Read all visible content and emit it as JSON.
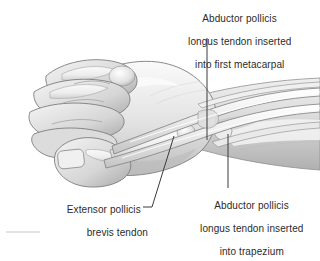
{
  "figure": {
    "kind": "anatomical-illustration",
    "style": "grayscale pen-and-ink medical drawing",
    "background_color": "#ffffff",
    "text_color": "#2b2b2b",
    "leader_color": "#3a3a3a"
  },
  "labels": {
    "apl_metacarpal": {
      "line1": "Abductor pollicis",
      "line2": "longus tendon inserted",
      "line3": "into first metacarpal"
    },
    "apl_trapezium": {
      "line1": "Abductor pollicis",
      "line2": "longus tendon inserted",
      "line3": "into trapezium"
    },
    "epb": {
      "line1": "Extensor pollicis",
      "line2": "brevis tendon"
    }
  },
  "leaders": [
    {
      "name": "leader-apl-metacarpal",
      "orientation": "vertical",
      "from": [
        207,
        38
      ],
      "to": [
        207,
        140
      ]
    },
    {
      "name": "leader-apl-trapezium",
      "orientation": "vertical",
      "from": [
        228,
        134
      ],
      "to": [
        228,
        188
      ]
    },
    {
      "name": "leader-epb",
      "orientation": "diagonal",
      "from": [
        174,
        136
      ],
      "to": [
        152,
        210
      ]
    }
  ],
  "palette": {
    "skin_light": "#f2f2f2",
    "skin_mid": "#d8d8d8",
    "skin_shadow": "#b4b4b4",
    "skin_deep": "#949494",
    "bone_light": "#fafafa",
    "bone_edge": "#8c8c8c",
    "tendon": "#e6e6e6",
    "outline": "#5a5a5a"
  }
}
